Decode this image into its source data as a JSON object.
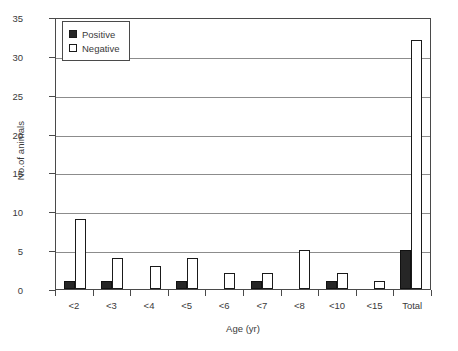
{
  "chart_data": {
    "type": "bar",
    "title": "",
    "subtitle": "",
    "xlabel": "Age (yr)",
    "ylabel": "No.of animals",
    "categories": [
      "<2",
      "<3",
      "<4",
      "<5",
      "<6",
      "<7",
      "<8",
      "<10",
      "<15",
      "Total"
    ],
    "series": [
      {
        "name": "Positive",
        "color": "#262626",
        "values": [
          1,
          1,
          0,
          1,
          0,
          1,
          0,
          1,
          0,
          5
        ]
      },
      {
        "name": "Negative",
        "color": "#ffffff",
        "values": [
          9,
          4,
          3,
          4,
          2,
          2,
          5,
          2,
          1,
          32
        ]
      }
    ],
    "ylim": [
      0,
      35
    ],
    "yticks": [
      0,
      5,
      10,
      15,
      20,
      25,
      30,
      35
    ],
    "ytick_labels": [
      "0",
      "5",
      "10",
      "15",
      "20",
      "25",
      "30",
      "35"
    ],
    "grid": true,
    "grid_axis": "y",
    "legend": {
      "position": "upper-left-inside",
      "entries": [
        {
          "label": "Positive",
          "swatch": "filled-black-square"
        },
        {
          "label": "Negative",
          "swatch": "open-white-square"
        }
      ]
    },
    "bar_style": {
      "outline_color": "#1a1a1a",
      "grouped": true,
      "group_gap": true
    }
  }
}
